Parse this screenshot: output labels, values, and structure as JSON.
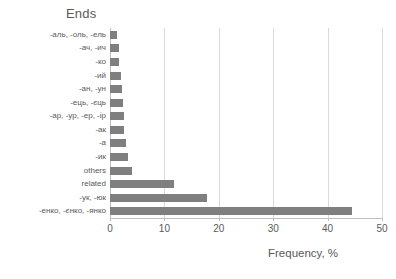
{
  "chart_data": {
    "type": "bar",
    "orientation": "horizontal",
    "title": "Ends",
    "xlabel": "Frequency, %",
    "ylabel": "",
    "xlim": [
      0,
      50
    ],
    "xticks": [
      0,
      10,
      20,
      30,
      40,
      50
    ],
    "grid": true,
    "legend": null,
    "bar_color": "#7f7f7f",
    "categories": [
      "-аль, -оль, -ель",
      "-ач, -ич",
      "-ко",
      "-ий",
      "-ан, -ун",
      "-ець, -єць",
      "-ар, -ур, -ер, -ір",
      "-ак",
      "-а",
      "-ик",
      "others",
      "related",
      "-ук, -юк",
      "-енко, -єнко, -янко"
    ],
    "values": [
      1.2,
      1.6,
      1.7,
      2.1,
      2.2,
      2.3,
      2.6,
      2.6,
      3.0,
      3.4,
      4.0,
      11.8,
      17.8,
      44.5
    ]
  }
}
